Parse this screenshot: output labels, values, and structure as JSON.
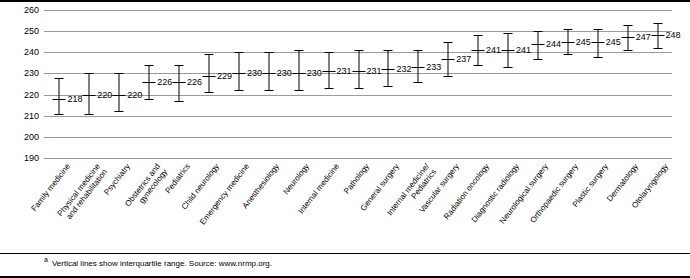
{
  "chart_data": {
    "type": "scatter",
    "title": "",
    "xlabel": "",
    "ylabel": "",
    "ylim": [
      190,
      260
    ],
    "yticks": [
      190,
      200,
      210,
      220,
      230,
      240,
      250,
      260
    ],
    "grid": true,
    "legend": "none",
    "annotation": "Vertical lines show interquartile range. Source: www.nrmp.org.",
    "footnote_marker": "a",
    "categories": [
      "Family medicine",
      "Physical medicine\nand rehabilitation",
      "Psychiatry",
      "Obstetrics and\ngynecology",
      "Pediatrics",
      "Child neurology",
      "Emergency medicine",
      "Anesthesiology",
      "Neurology",
      "Internal medicine",
      "Pathology",
      "General surgery",
      "Internal medicine/\nPediatrics",
      "Vascular surgery",
      "Radiation oncology",
      "Diagnostic radiology",
      "Neurological surgery",
      "Orthopaedic surgery",
      "Plastic surgery",
      "Dermatology",
      "Otolaryngology"
    ],
    "values": [
      218,
      220,
      220,
      226,
      226,
      229,
      230,
      230,
      230,
      231,
      231,
      232,
      233,
      237,
      241,
      241,
      244,
      245,
      245,
      247,
      248
    ],
    "q1": [
      211,
      211,
      212,
      218,
      217,
      221,
      222,
      222,
      222,
      223,
      223,
      224,
      226,
      229,
      234,
      233,
      237,
      239,
      238,
      241,
      242
    ],
    "q3": [
      228,
      230,
      230,
      234,
      234,
      239,
      240,
      240,
      241,
      240,
      241,
      241,
      241,
      245,
      248,
      249,
      250,
      251,
      251,
      253,
      254
    ]
  }
}
